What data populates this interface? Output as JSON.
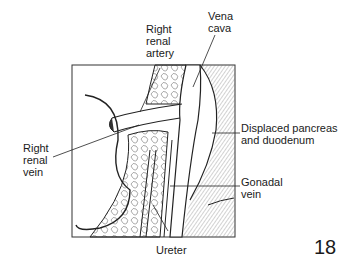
{
  "figure": {
    "labels": {
      "right_renal_artery": [
        "Right",
        "renal",
        "artery"
      ],
      "vena_cava": [
        "Vena",
        "cava"
      ],
      "right_renal_vein": [
        "Right",
        "renal",
        "vein"
      ],
      "displaced_pancreas": [
        "Displaced pancreas",
        "and duodenum"
      ],
      "gonadal_vein": [
        "Gonadal",
        "vein"
      ],
      "ureter": [
        "Ureter"
      ]
    },
    "page_number": "18"
  }
}
